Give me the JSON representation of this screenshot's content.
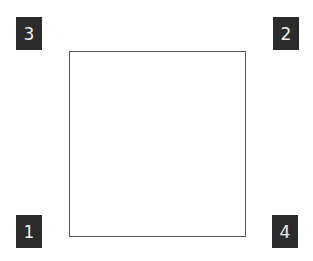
{
  "diagram": {
    "square": {
      "label": ""
    },
    "corners": [
      {
        "id": "top-left",
        "label": "3"
      },
      {
        "id": "top-right",
        "label": "2"
      },
      {
        "id": "bottom-left",
        "label": "1"
      },
      {
        "id": "bottom-right",
        "label": "4"
      }
    ],
    "colors": {
      "label_bg": "#2b2b2b",
      "label_text": "#eeeeee",
      "square_border": "#555555"
    }
  }
}
